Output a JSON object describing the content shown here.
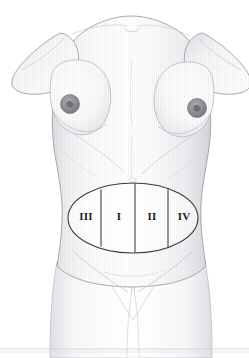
{
  "figure": {
    "view": "anterior",
    "background_color": "#ffffff",
    "skin_fill": "#fbfbfc",
    "skin_highlight": "#ffffff",
    "skin_shadow": "#e3e4e7",
    "outline_color": "#9a9ca2",
    "detail_line_color": "#b9bbc0",
    "areola_color": "#8e9095",
    "areola_edge_color": "#74767b",
    "nipple_color": "#6f7176",
    "overlay_line_color": "#3a3a3c",
    "label_color": "#1d1d1d",
    "baseline_rule_color": "#c9cbd0"
  },
  "overlay": {
    "shape": "ellipse",
    "name": "abdominal-zone-ellipse",
    "center_x": 133,
    "center_y": 218,
    "radius_x": 65,
    "radius_y": 35,
    "divider_count": 3,
    "dividers_x": [
      101,
      135,
      168
    ],
    "zones": [
      {
        "id": "zone-3",
        "label": "III",
        "x": 86,
        "y": 217,
        "order": 1,
        "side": "left-lateral"
      },
      {
        "id": "zone-1",
        "label": "I",
        "x": 119,
        "y": 217,
        "order": 2,
        "side": "left-medial"
      },
      {
        "id": "zone-2",
        "label": "II",
        "x": 152,
        "y": 217,
        "order": 3,
        "side": "right-medial"
      },
      {
        "id": "zone-4",
        "label": "IV",
        "x": 184,
        "y": 217,
        "order": 4,
        "side": "right-lateral"
      }
    ]
  },
  "anatomy": {
    "left_areola": {
      "cx": 70,
      "cy": 104,
      "r": 9.5
    },
    "right_areola": {
      "cx": 197,
      "cy": 108,
      "r": 9.5
    },
    "left_nipple": {
      "cx": 70,
      "cy": 104,
      "r": 3.2
    },
    "right_nipple": {
      "cx": 197,
      "cy": 108,
      "r": 3.2
    },
    "navel": {
      "cx": 132,
      "cy": 181
    }
  },
  "canvas": {
    "width": 249,
    "height": 358
  }
}
